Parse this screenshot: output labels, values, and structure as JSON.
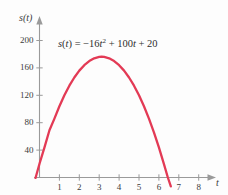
{
  "chart_data": {
    "type": "line",
    "title": "",
    "subtitle": "",
    "xlabel": "t",
    "ylabel": "s(t)",
    "annotation": "s(t) = −16t² + 100t + 20",
    "equation": {
      "lhs_fn": "s",
      "lhs_var": "t",
      "equals": "=",
      "minus": "−",
      "coef_quadratic": "16",
      "var_quadratic": "t",
      "exponent": "2",
      "plus_1": "+",
      "coef_linear": "100",
      "var_linear": "t",
      "plus_2": "+",
      "constant": "20"
    },
    "grid": false,
    "legend": null,
    "xlim": [
      0,
      8.8
    ],
    "ylim": [
      0,
      225
    ],
    "xticks": [
      "1",
      "2",
      "3",
      "4",
      "5",
      "6",
      "7",
      "8"
    ],
    "xtick_values": [
      1,
      2,
      3,
      4,
      5,
      6,
      7,
      8
    ],
    "yticks": [
      "40",
      "80",
      "120",
      "160",
      "200"
    ],
    "ytick_values": [
      40,
      80,
      120,
      160,
      200
    ],
    "curve_color": "#e33a55",
    "axis_color": "#9a9a9a",
    "text_color": "#3b3b3b",
    "vertex": {
      "t": 3.125,
      "s": 176.25
    },
    "y_intercept": 20,
    "positive_root": 6.45,
    "series": [
      {
        "name": "s(t)",
        "x": [
          -0.2,
          0.0,
          0.25,
          0.5,
          0.75,
          1.0,
          1.25,
          1.5,
          1.75,
          2.0,
          2.25,
          2.5,
          2.75,
          3.0,
          3.125,
          3.25,
          3.5,
          3.75,
          4.0,
          4.25,
          4.5,
          4.75,
          5.0,
          5.25,
          5.5,
          5.75,
          6.0,
          6.25,
          6.45,
          6.6
        ],
        "y": [
          -0.64,
          20,
          44,
          69,
          86,
          104,
          120,
          134,
          146,
          156,
          164,
          170,
          174,
          176,
          176.25,
          176,
          174,
          170,
          164,
          156,
          146,
          134,
          120,
          104,
          86,
          66,
          44,
          20,
          0,
          -13
        ]
      }
    ]
  }
}
